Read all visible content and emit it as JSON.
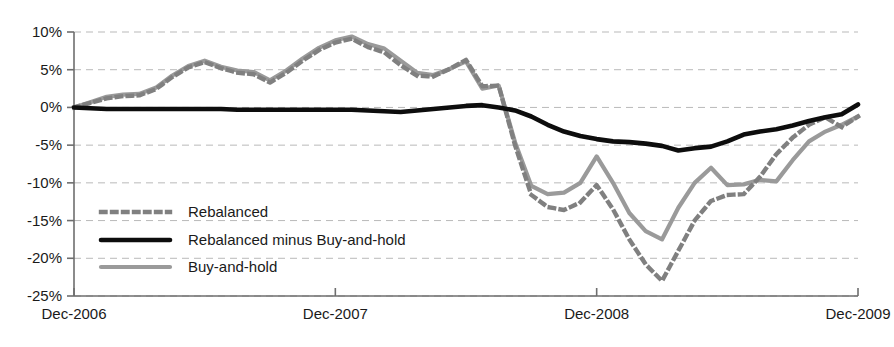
{
  "chart_data": {
    "type": "line",
    "title": "",
    "xlabel": "",
    "ylabel": "",
    "ylim": [
      -25,
      10
    ],
    "ytick_labels": [
      "10%",
      "5%",
      "0%",
      "-5%",
      "-10%",
      "-15%",
      "-20%",
      "-25%"
    ],
    "ytick_values": [
      10,
      5,
      0,
      -5,
      -10,
      -15,
      -20,
      -25
    ],
    "xtick_labels": [
      "Dec-2006",
      "Dec-2007",
      "Dec-2008",
      "Dec-2009"
    ],
    "xtick_values": [
      0,
      12,
      24,
      36
    ],
    "xlim": [
      0,
      36
    ],
    "grid": true,
    "legend_position": "inside-left",
    "x": [
      0,
      1,
      2,
      3,
      4,
      5,
      6,
      7,
      8,
      9,
      10,
      11,
      12,
      13,
      14,
      15,
      16,
      17,
      18,
      19,
      20,
      21,
      22,
      23,
      24,
      25,
      26,
      27,
      28,
      29,
      30,
      31,
      32,
      33,
      34,
      35,
      36
    ],
    "series": [
      {
        "name": "Rebalanced",
        "color": "#808080",
        "style": "dotted",
        "values": [
          0.0,
          0.6,
          1.2,
          1.5,
          1.6,
          2.4,
          4.0,
          5.3,
          6.0,
          5.2,
          4.6,
          4.4,
          3.3,
          4.6,
          6.2,
          7.6,
          8.6,
          9.1,
          8.0,
          7.3,
          5.6,
          4.2,
          4.1,
          5.1,
          6.3,
          2.8,
          2.9,
          -5.0,
          -11.6,
          -13.2,
          -13.6,
          -12.6,
          -10.3,
          -13.5,
          -17.5,
          -20.8,
          -23.0
        ]
      },
      {
        "name": "Rebalanced minus Buy-and-hold",
        "color": "#0d0d0d",
        "style": "solid",
        "values": [
          0.0,
          -0.1,
          -0.2,
          -0.2,
          -0.2,
          -0.2,
          -0.2,
          -0.2,
          -0.2,
          -0.2,
          -0.3,
          -0.3,
          -0.3,
          -0.3,
          -0.3,
          -0.3,
          -0.3,
          -0.3,
          -0.4,
          -0.5,
          -0.6,
          -0.4,
          -0.2,
          0.0,
          0.2,
          0.3,
          0.0,
          -0.4,
          -1.2,
          -2.3,
          -3.2,
          -3.8,
          -4.2,
          -4.5,
          -4.6,
          -4.8,
          -5.1
        ]
      },
      {
        "name": "Buy-and-hold",
        "color": "#9a9a9a",
        "style": "solid",
        "values": [
          0.0,
          0.7,
          1.4,
          1.7,
          1.8,
          2.6,
          4.2,
          5.5,
          6.2,
          5.4,
          4.9,
          4.7,
          3.6,
          4.9,
          6.5,
          7.9,
          8.9,
          9.4,
          8.4,
          7.8,
          6.2,
          4.6,
          4.3,
          5.1,
          6.1,
          2.5,
          2.9,
          -4.6,
          -10.4,
          -11.5,
          -11.3,
          -10.0,
          -6.5,
          -10.0,
          -14.0,
          -16.4,
          -17.5
        ]
      }
    ],
    "series_extended": {
      "note": "monthly points Dec-2006 through Dec-2009",
      "x_tail": [
        37,
        38,
        39,
        40,
        41,
        42,
        43,
        44,
        45,
        46,
        47,
        48
      ],
      "rebalanced_tail": [
        -19.0,
        -15.0,
        -12.4,
        -11.6,
        -11.5,
        -9.2,
        -6.2,
        -4.0,
        -2.3,
        -1.3,
        -2.6,
        -1.2
      ],
      "diff_tail": [
        -5.7,
        -5.4,
        -5.2,
        -4.5,
        -3.6,
        -3.2,
        -2.9,
        -2.4,
        -1.8,
        -1.3,
        -0.9,
        0.4
      ],
      "bah_tail": [
        -13.3,
        -10.0,
        -8.0,
        -10.3,
        -10.2,
        -9.6,
        -9.8,
        -7.0,
        -4.5,
        -3.2,
        -2.3,
        -1.2
      ]
    }
  },
  "legend": {
    "items": [
      {
        "label": "Rebalanced"
      },
      {
        "label": "Rebalanced minus Buy-and-hold"
      },
      {
        "label": "Buy-and-hold"
      }
    ]
  },
  "axes": {
    "y_labels": [
      "10%",
      "5%",
      "0%",
      "-5%",
      "-10%",
      "-15%",
      "-20%",
      "-25%"
    ],
    "x_labels": [
      "Dec-2006",
      "Dec-2007",
      "Dec-2008",
      "Dec-2009"
    ]
  }
}
